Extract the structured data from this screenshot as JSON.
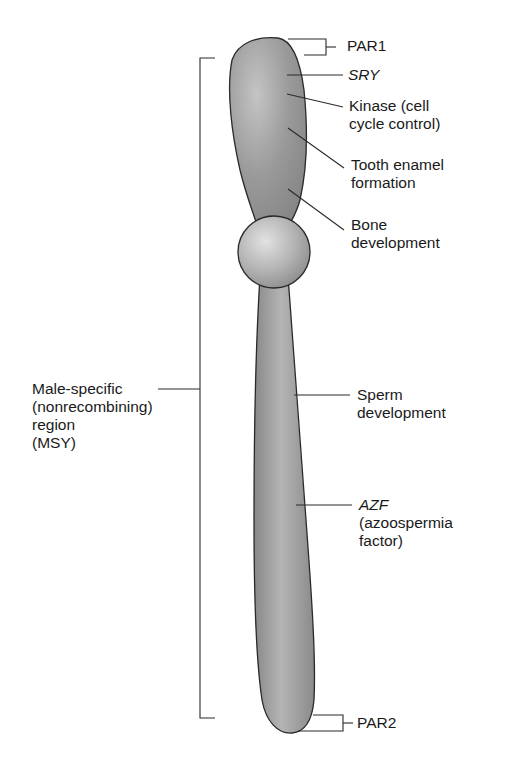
{
  "diagram": {
    "colors": {
      "chromosome_fill": "#8c8c8c",
      "chromosome_highlight": "#c8c8c8",
      "outline": "#2a2a2a",
      "centromere_fill": "#a8a8a8",
      "text": "#1a1a1a"
    },
    "labels": {
      "par1": "PAR1",
      "sry": "SRY",
      "kinase": "Kinase (cell\ncycle control)",
      "tooth": "Tooth enamel\nformation",
      "bone": "Bone\ndevelopment",
      "msy": "Male-specific\n(nonrecombining)\nregion\n(MSY)",
      "sperm": "Sperm\ndevelopment",
      "azf_gene": "AZF",
      "azf_desc": "(azoospermia\nfactor)",
      "par2": "PAR2"
    }
  }
}
